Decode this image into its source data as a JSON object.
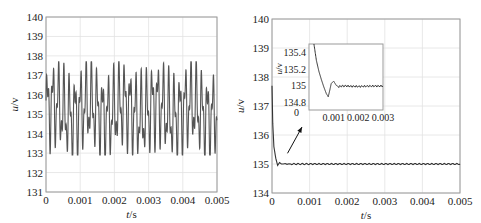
{
  "figure": {
    "background": "#ffffff",
    "line_color": "#333333",
    "grid_color": "#e2e2e2",
    "frame_color": "#9a9a9a"
  },
  "chart_data": [
    {
      "type": "line",
      "title": "",
      "xlabel": "t/s",
      "ylabel": "u/v",
      "xlim": [
        0,
        0.005
      ],
      "ylim": [
        131,
        140
      ],
      "xticks": [
        0,
        0.001,
        0.002,
        0.003,
        0.004,
        0.005
      ],
      "xtick_labels": [
        "0",
        "0.001",
        "0.002",
        "0.003",
        "0.004",
        "0.005"
      ],
      "yticks": [
        131,
        132,
        133,
        134,
        135,
        136,
        137,
        138,
        139,
        140
      ],
      "ytick_labels": [
        "131",
        "132",
        "133",
        "134",
        "135",
        "136",
        "137",
        "138",
        "139",
        "140"
      ],
      "grid": true,
      "description": "Oscillating voltage, mean ~135.2 V, peaks ~137.7 V, troughs ~132.9 V, dense multi-frequency ripple",
      "series": [
        {
          "name": "u",
          "model": "135.2 + 1.6*sin(2*pi*6200*t) + 0.9*sin(2*pi*13700*t+0.6) + 0.35*sin(2*pi*1000*t)",
          "y_max": 137.7,
          "y_min": 132.9,
          "mean": 135.2
        }
      ]
    },
    {
      "type": "line",
      "title": "",
      "xlabel": "t/s",
      "ylabel": "u/v",
      "xlim": [
        0,
        0.005
      ],
      "ylim": [
        134,
        140
      ],
      "xticks": [
        0,
        0.001,
        0.002,
        0.003,
        0.004,
        0.005
      ],
      "xtick_labels": [
        "0",
        "0.001",
        "0.002",
        "0.003",
        "0.004",
        "0.005"
      ],
      "yticks": [
        134,
        135,
        136,
        137,
        138,
        139,
        140
      ],
      "ytick_labels": [
        "134",
        "135",
        "136",
        "137",
        "138",
        "139",
        "140"
      ],
      "grid": true,
      "description": "Fast transient from ~137.7 V settling to 135 V within ~0.0003 s, then flat at 135 V with tiny ripple",
      "series": [
        {
          "name": "u",
          "x": [
            0,
            2e-05,
            5e-05,
            0.0001,
            0.00015,
            0.0002,
            0.00025,
            0.0003,
            0.0005,
            0.001,
            0.002,
            0.003,
            0.004,
            0.005
          ],
          "y": [
            137.7,
            136.4,
            135.6,
            135.2,
            134.95,
            135.05,
            135.0,
            135.0,
            135.0,
            135.0,
            135.0,
            135.0,
            135.0,
            135.0
          ]
        }
      ],
      "annotation": {
        "type": "arrow",
        "from": [
          0.0002,
          135.3
        ],
        "to": [
          0.0013,
          136.2
        ],
        "label": ""
      },
      "inset": {
        "type": "line",
        "xlabel": "",
        "ylabel": "u/v",
        "xlim": [
          0,
          0.003
        ],
        "ylim": [
          134.7,
          135.5
        ],
        "xticks": [
          0.001,
          0.002,
          0.003
        ],
        "xtick_labels": [
          "0.001",
          "0.002",
          "0.003"
        ],
        "x_origin_label": "0",
        "yticks": [
          134.8,
          135,
          135.2,
          135.4
        ],
        "ytick_labels": [
          "134.8",
          "135",
          "135.2",
          "135.4"
        ],
        "series": [
          {
            "name": "u (zoom)",
            "x": [
              0.0002,
              0.0003,
              0.0004,
              0.0005,
              0.0006,
              0.0007,
              0.00078,
              0.00085,
              0.0009,
              0.001,
              0.0011,
              0.0012,
              0.0013,
              0.0015,
              0.002,
              0.0025,
              0.003
            ],
            "y": [
              135.5,
              135.3,
              135.17,
              135.07,
              134.98,
              134.9,
              134.86,
              134.95,
              135.02,
              135.05,
              135.0,
              134.98,
              134.99,
              134.99,
              134.985,
              134.99,
              134.99
            ]
          }
        ]
      }
    }
  ]
}
